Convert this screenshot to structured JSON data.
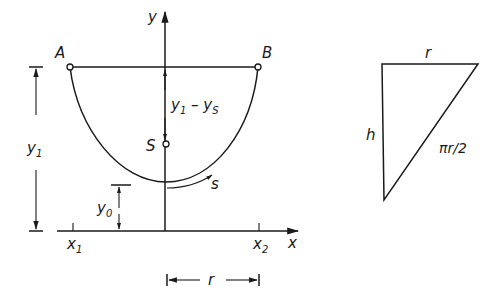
{
  "figure": {
    "left_diagram": {
      "points": {
        "A": {
          "label": "A"
        },
        "B": {
          "label": "B"
        },
        "S": {
          "label": "S"
        }
      },
      "axes": {
        "x_label": "x",
        "y_label": "y"
      },
      "ticks": {
        "x1": {
          "base": "x",
          "sub": "1"
        },
        "x2": {
          "base": "x",
          "sub": "2"
        }
      },
      "dimensions": {
        "y1": {
          "base": "y",
          "sub": "1"
        },
        "y0": {
          "base": "y",
          "sub": "0"
        },
        "y1_minus_ys": {
          "base1": "y",
          "sub1": "1",
          "op": " – ",
          "base2": "y",
          "sub2": "S"
        },
        "r": "r",
        "arc_s": "s"
      }
    },
    "right_diagram": {
      "top_label": "r",
      "left_label": "h",
      "hypotenuse_label": "πr/2"
    }
  }
}
